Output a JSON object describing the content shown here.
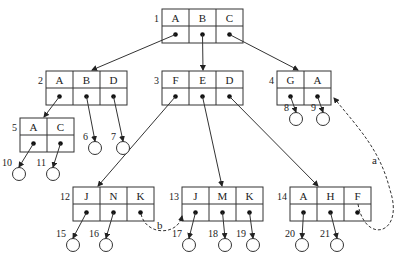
{
  "diagram": {
    "type": "b-tree",
    "nodes": [
      {
        "id": "1",
        "label": "1",
        "keys": [
          "A",
          "B",
          "C"
        ]
      },
      {
        "id": "2",
        "label": "2",
        "keys": [
          "A",
          "B",
          "D"
        ]
      },
      {
        "id": "3",
        "label": "3",
        "keys": [
          "F",
          "E",
          "D"
        ]
      },
      {
        "id": "4",
        "label": "4",
        "keys": [
          "G",
          "A"
        ]
      },
      {
        "id": "5",
        "label": "5",
        "keys": [
          "A",
          "C"
        ]
      },
      {
        "id": "12",
        "label": "12",
        "keys": [
          "J",
          "N",
          "K"
        ]
      },
      {
        "id": "13",
        "label": "13",
        "keys": [
          "J",
          "M",
          "K"
        ]
      },
      {
        "id": "14",
        "label": "14",
        "keys": [
          "A",
          "H",
          "F"
        ]
      }
    ],
    "leaves": [
      "6",
      "7",
      "8",
      "9",
      "10",
      "11",
      "15",
      "16",
      "17",
      "18",
      "19",
      "20",
      "21"
    ],
    "dashed_links": [
      {
        "label": "a",
        "from": "14.F",
        "to": "4"
      },
      {
        "label": "b",
        "from": "12.K",
        "to": "13"
      }
    ]
  }
}
